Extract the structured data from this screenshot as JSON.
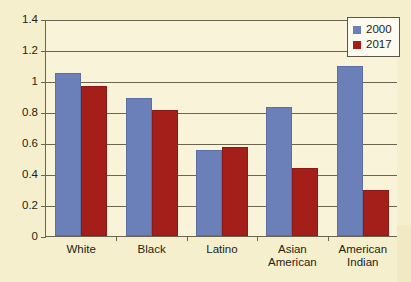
{
  "chart_data": {
    "type": "bar",
    "title": "",
    "subtitle": "",
    "xlabel": "",
    "ylabel": "",
    "categories": [
      "White",
      "Black",
      "Latino",
      "Asian\nAmerican",
      "American\nIndian"
    ],
    "series": [
      {
        "name": "2000",
        "color": "#6b80b8",
        "values": [
          1.05,
          0.89,
          0.555,
          0.83,
          1.1
        ]
      },
      {
        "name": "2017",
        "color": "#a41f1a",
        "values": [
          0.97,
          0.81,
          0.575,
          0.44,
          0.3
        ]
      }
    ],
    "ylim": [
      0,
      1.4
    ],
    "ytick_labels": [
      "0",
      "0.2",
      "0.4",
      "0.6",
      "0.8",
      "1",
      "1.2",
      "1.4"
    ],
    "ytick_values": [
      0,
      0.2,
      0.4,
      0.6,
      0.8,
      1,
      1.2,
      1.4
    ],
    "grid": true,
    "legend_position": "top-right"
  },
  "legend": {
    "entries": [
      {
        "label": "2000",
        "swatch": "blue-swatch-icon"
      },
      {
        "label": "2017",
        "swatch": "red-swatch-icon"
      }
    ]
  },
  "colors": {
    "background": "#f6efcd",
    "plot_background": "#f9f3d9",
    "axis": "#6b6550",
    "series_2000": "#6b80b8",
    "series_2017": "#a41f1a",
    "text": "#231f14"
  }
}
